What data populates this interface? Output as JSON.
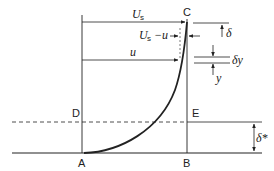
{
  "diagram": {
    "points": {
      "A": "A",
      "B": "B",
      "C": "C",
      "D": "D",
      "E": "E"
    },
    "labels": {
      "free_stream_velocity": "U",
      "free_stream_subscript": "s",
      "velocity_deficit_main": "U",
      "velocity_deficit_subscript": "s",
      "velocity_deficit_rest": "−u",
      "local_velocity": "u",
      "boundary_layer_thickness": "δ",
      "element_thickness": "δy",
      "height": "y",
      "displacement_thickness": "δ*"
    },
    "colors": {
      "line": "#222222",
      "background": "#ffffff"
    }
  }
}
